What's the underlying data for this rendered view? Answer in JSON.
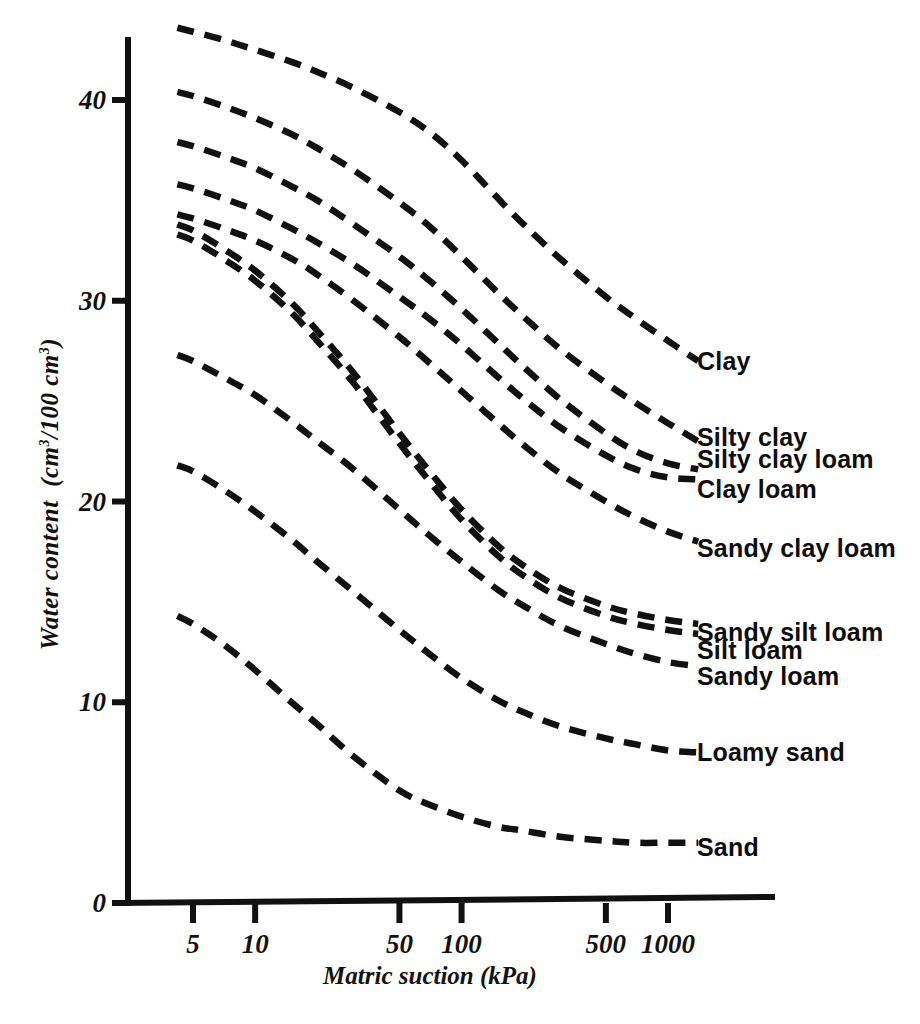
{
  "chart_data": {
    "type": "line",
    "title": "",
    "xlabel": "Matric suction  (kPa)",
    "ylabel": "Water content (cm3/100 cm3)",
    "ylabel_parts": {
      "main": "Water content  (cm",
      "sup1": "3",
      "mid": "/100 cm",
      "sup2": "3",
      "tail": ")"
    },
    "xscale": "log",
    "xticks": [
      5,
      10,
      50,
      100,
      500,
      1000
    ],
    "xtick_labels": [
      "5",
      "10",
      "50",
      "100",
      "500",
      "1000"
    ],
    "xlim": [
      4.0,
      1800
    ],
    "yticks": [
      0,
      10,
      20,
      30,
      40
    ],
    "ytick_labels": [
      "0",
      "10",
      "20",
      "30",
      "40"
    ],
    "ylim": [
      0,
      44
    ],
    "grid": false,
    "legend": "inline-right-of-curve-ends",
    "linestyle": "dashed",
    "color": "#111111",
    "series": [
      {
        "name": "Clay",
        "label": "Clay",
        "x": [
          4.2,
          5,
          7,
          10,
          15,
          20,
          30,
          50,
          70,
          100,
          150,
          200,
          300,
          500,
          700,
          1000,
          1400
        ],
        "values": [
          43.6,
          43.4,
          43.0,
          42.5,
          41.9,
          41.4,
          40.6,
          39.4,
          38.4,
          37.0,
          35.1,
          33.8,
          32.1,
          30.2,
          29.1,
          28.0,
          27.0
        ]
      },
      {
        "name": "Silty clay",
        "label": "Silty clay",
        "x": [
          4.2,
          5,
          7,
          10,
          15,
          20,
          30,
          50,
          70,
          100,
          150,
          200,
          300,
          500,
          700,
          1000,
          1400
        ],
        "values": [
          40.4,
          40.2,
          39.7,
          39.1,
          38.3,
          37.6,
          36.5,
          34.9,
          33.7,
          32.2,
          30.4,
          29.2,
          27.6,
          25.9,
          24.9,
          23.9,
          23.0
        ]
      },
      {
        "name": "Silty clay loam",
        "label": "Silty clay loam",
        "x": [
          4.2,
          5,
          7,
          10,
          15,
          20,
          30,
          50,
          70,
          100,
          150,
          200,
          300,
          500,
          700,
          1000,
          1400
        ],
        "values": [
          37.9,
          37.7,
          37.2,
          36.6,
          35.7,
          35.0,
          33.8,
          32.2,
          31.0,
          29.6,
          27.9,
          26.7,
          25.1,
          23.4,
          22.5,
          21.9,
          21.6
        ]
      },
      {
        "name": "Clay loam",
        "label": "Clay loam",
        "x": [
          4.2,
          5,
          7,
          10,
          15,
          20,
          30,
          50,
          70,
          100,
          150,
          200,
          300,
          500,
          700,
          1000,
          1400
        ],
        "values": [
          35.8,
          35.6,
          35.1,
          34.5,
          33.6,
          32.9,
          31.8,
          30.2,
          29.1,
          27.8,
          26.2,
          25.1,
          23.7,
          22.3,
          21.6,
          21.2,
          21.1
        ]
      },
      {
        "name": "Sandy clay loam",
        "label": "Sandy clay loam",
        "x": [
          4.2,
          5,
          7,
          10,
          15,
          20,
          30,
          50,
          70,
          100,
          150,
          200,
          300,
          500,
          700,
          1000,
          1400
        ],
        "values": [
          34.3,
          34.1,
          33.6,
          33.0,
          32.1,
          31.3,
          30.0,
          28.2,
          26.9,
          25.5,
          23.9,
          22.8,
          21.4,
          20.0,
          19.2,
          18.5,
          18.0
        ]
      },
      {
        "name": "Sandy silt loam",
        "label": "Sandy silt loam",
        "x": [
          4.2,
          5,
          7,
          10,
          15,
          20,
          30,
          50,
          70,
          100,
          150,
          200,
          300,
          500,
          700,
          1000,
          1400
        ],
        "values": [
          33.8,
          33.5,
          32.6,
          31.5,
          29.9,
          28.5,
          26.4,
          23.4,
          21.5,
          19.6,
          17.8,
          16.8,
          15.7,
          14.8,
          14.4,
          14.1,
          13.9
        ]
      },
      {
        "name": "Silt loam",
        "label": "Silt loam",
        "x": [
          4.2,
          5,
          7,
          10,
          15,
          20,
          30,
          50,
          70,
          100,
          150,
          200,
          300,
          500,
          700,
          1000,
          1400
        ],
        "values": [
          33.3,
          33.0,
          32.1,
          31.0,
          29.4,
          28.0,
          25.9,
          22.9,
          21.0,
          19.1,
          17.3,
          16.3,
          15.2,
          14.3,
          13.9,
          13.6,
          13.4
        ]
      },
      {
        "name": "Sandy loam",
        "label": "Sandy loam",
        "x": [
          4.2,
          5,
          7,
          10,
          15,
          20,
          30,
          50,
          70,
          100,
          150,
          200,
          300,
          500,
          700,
          1000,
          1400
        ],
        "values": [
          27.3,
          27.0,
          26.2,
          25.3,
          24.0,
          23.0,
          21.6,
          19.6,
          18.3,
          17.0,
          15.6,
          14.8,
          13.8,
          12.9,
          12.4,
          12.0,
          11.8
        ]
      },
      {
        "name": "Loamy sand",
        "label": "Loamy sand",
        "x": [
          4.2,
          5,
          7,
          10,
          15,
          20,
          30,
          50,
          70,
          100,
          150,
          200,
          300,
          500,
          700,
          1000,
          1400
        ],
        "values": [
          21.8,
          21.5,
          20.6,
          19.5,
          18.1,
          17.0,
          15.5,
          13.6,
          12.4,
          11.2,
          10.1,
          9.5,
          8.8,
          8.2,
          7.9,
          7.6,
          7.5
        ]
      },
      {
        "name": "Sand",
        "label": "Sand",
        "x": [
          4.2,
          5,
          7,
          10,
          15,
          20,
          30,
          50,
          70,
          100,
          150,
          200,
          300,
          500,
          700,
          1000,
          1400
        ],
        "values": [
          14.3,
          13.9,
          12.9,
          11.6,
          10.0,
          8.9,
          7.3,
          5.6,
          4.9,
          4.3,
          3.8,
          3.6,
          3.3,
          3.1,
          3.0,
          3.0,
          3.0
        ]
      }
    ],
    "label_positions": [
      {
        "name": "Clay",
        "y": 27.0
      },
      {
        "name": "Silty clay",
        "y": 23.2
      },
      {
        "name": "Silty clay loam",
        "y": 22.1
      },
      {
        "name": "Clay loam",
        "y": 20.6
      },
      {
        "name": "Sandy clay loam",
        "y": 17.7
      },
      {
        "name": "Sandy silt loam",
        "y": 13.5
      },
      {
        "name": "Silt loam",
        "y": 12.6
      },
      {
        "name": "Sandy loam",
        "y": 11.3
      },
      {
        "name": "Loamy sand",
        "y": 7.5
      },
      {
        "name": "Sand",
        "y": 2.8
      }
    ]
  }
}
